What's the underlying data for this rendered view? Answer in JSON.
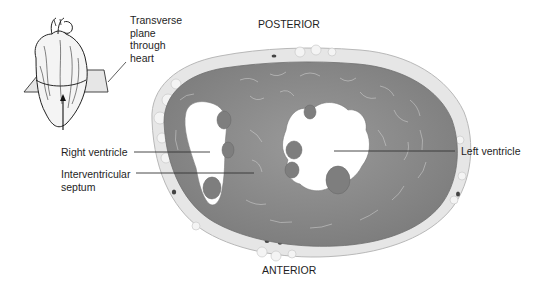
{
  "orientation": {
    "top": "POSTERIOR",
    "bottom": "ANTERIOR"
  },
  "inset": {
    "caption_lines": [
      "Transverse",
      "plane",
      "through",
      "heart"
    ]
  },
  "labels": {
    "right_ventricle": "Right ventricle",
    "interventricular_lines": [
      "Interventricular",
      "septum"
    ],
    "left_ventricle": "Left ventricle"
  },
  "colors": {
    "myocardium": "#8a8a8a",
    "fat": "#e4e4e4",
    "lumen": "#ffffff",
    "text": "#1e1e1e",
    "leader": "#333333"
  }
}
